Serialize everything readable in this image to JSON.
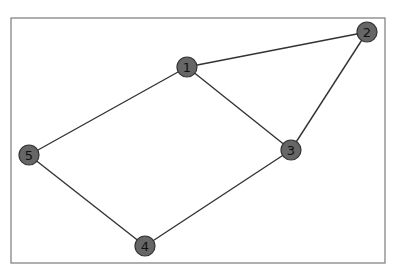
{
  "diagram": {
    "type": "undirected-graph",
    "frame": {
      "x": 11,
      "y": 18,
      "width": 374,
      "height": 245,
      "stroke": "#7a7a7a"
    },
    "style": {
      "node_fill": "#666666",
      "node_stroke": "#333333",
      "node_radius": 10,
      "edge_color": "#333333",
      "label_color": "#111111"
    },
    "nodes": [
      {
        "id": "1",
        "label": "1",
        "x": 187,
        "y": 67
      },
      {
        "id": "2",
        "label": "2",
        "x": 367,
        "y": 32
      },
      {
        "id": "3",
        "label": "3",
        "x": 291,
        "y": 150
      },
      {
        "id": "4",
        "label": "4",
        "x": 145,
        "y": 246
      },
      {
        "id": "5",
        "label": "5",
        "x": 29,
        "y": 155
      }
    ],
    "edges": [
      {
        "source": "1",
        "target": "2"
      },
      {
        "source": "1",
        "target": "3"
      },
      {
        "source": "1",
        "target": "5"
      },
      {
        "source": "2",
        "target": "3"
      },
      {
        "source": "3",
        "target": "4"
      },
      {
        "source": "4",
        "target": "5"
      }
    ]
  }
}
